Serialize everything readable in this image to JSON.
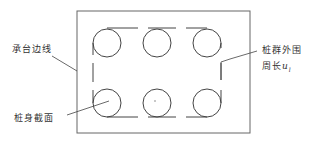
{
  "diagram": {
    "type": "pile-group-plan",
    "colors": {
      "stroke": "#444444",
      "cap_edge": "#666666",
      "text": "#333333",
      "background": "#ffffff"
    },
    "cap": {
      "x": 77,
      "y": 11,
      "width": 173,
      "height": 122
    },
    "piles": {
      "rows": 2,
      "cols": 3,
      "radius": 14,
      "centers": [
        [
          107,
          43
        ],
        [
          157,
          43
        ],
        [
          207,
          43
        ],
        [
          107,
          103
        ],
        [
          157,
          103
        ],
        [
          207,
          103
        ]
      ]
    },
    "perimeter": {
      "left": 93,
      "right": 233,
      "top": 28,
      "bottom": 117
    },
    "labels": {
      "cap_edge": "承台边线",
      "pile_section": "桩身截面",
      "group_perimeter_line1": "桩群外围",
      "group_perimeter_line2_prefix": "周长",
      "group_perimeter_symbol": "u",
      "group_perimeter_subscript": "l"
    }
  }
}
